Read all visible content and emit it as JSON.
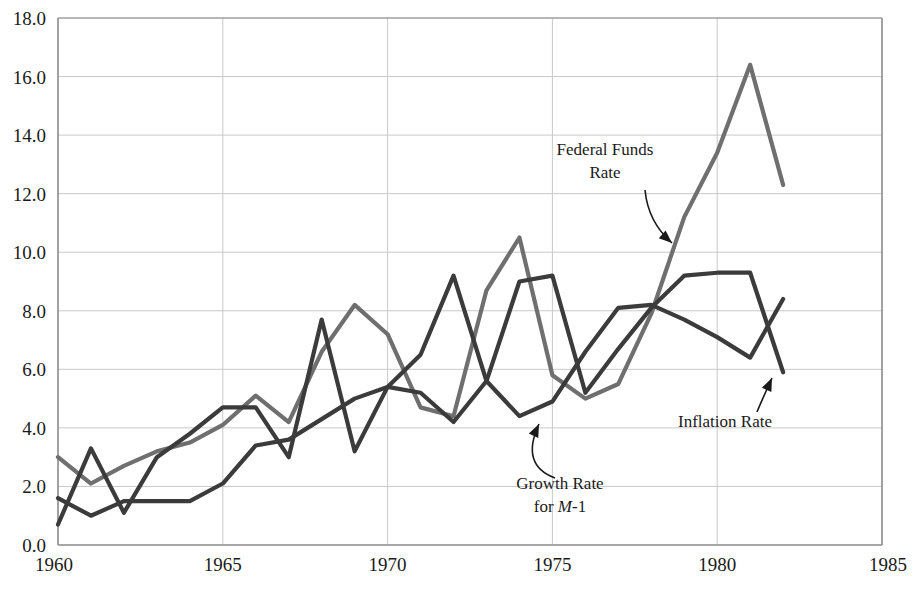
{
  "chart_data": {
    "type": "line",
    "title": "",
    "xlabel": "",
    "ylabel": "",
    "xlim": [
      1960,
      1985
    ],
    "ylim": [
      0.0,
      18.0
    ],
    "grid": true,
    "legend_position": "inline-annotations",
    "x_ticks": [
      "1960",
      "1965",
      "1970",
      "1975",
      "1980",
      "1985"
    ],
    "x_tick_values": [
      1960,
      1965,
      1970,
      1975,
      1980,
      1985
    ],
    "y_ticks": [
      "0.0",
      "2.0",
      "4.0",
      "6.0",
      "8.0",
      "10.0",
      "12.0",
      "14.0",
      "16.0",
      "18.0"
    ],
    "y_tick_values": [
      0.0,
      2.0,
      4.0,
      6.0,
      8.0,
      10.0,
      12.0,
      14.0,
      16.0,
      18.0
    ],
    "x": [
      1960,
      1961,
      1962,
      1963,
      1964,
      1965,
      1966,
      1967,
      1968,
      1969,
      1970,
      1971,
      1972,
      1973,
      1974,
      1975,
      1976,
      1977,
      1978,
      1979,
      1980,
      1981,
      1982
    ],
    "series": [
      {
        "name": "Federal Funds Rate",
        "color": "#6f6f6f",
        "values": [
          3.0,
          2.1,
          2.7,
          3.2,
          3.5,
          4.1,
          5.1,
          4.2,
          6.6,
          8.2,
          7.2,
          4.7,
          4.4,
          8.7,
          10.5,
          5.8,
          5.0,
          5.5,
          7.9,
          11.2,
          13.4,
          16.4,
          12.3
        ]
      },
      {
        "name": "Growth Rate for M-1",
        "color": "#3b3b3b",
        "values": [
          0.7,
          3.3,
          1.1,
          3.0,
          3.8,
          4.7,
          4.7,
          3.0,
          7.7,
          3.2,
          5.4,
          6.5,
          9.2,
          5.6,
          4.4,
          4.9,
          6.6,
          8.1,
          8.2,
          7.7,
          7.1,
          6.4,
          8.4
        ]
      },
      {
        "name": "Inflation Rate",
        "color": "#3b3b3b",
        "values": [
          1.6,
          1.0,
          1.5,
          1.5,
          1.5,
          2.1,
          3.4,
          3.6,
          4.3,
          5.0,
          5.4,
          5.2,
          4.2,
          5.6,
          9.0,
          9.2,
          5.2,
          6.7,
          8.1,
          9.2,
          9.3,
          9.3,
          5.9
        ]
      }
    ],
    "annotations": [
      {
        "id": "federal-funds-rate",
        "line1": "Federal Funds",
        "line2": "Rate",
        "text_x": 605,
        "text_y": 155,
        "arrow_from": [
          645,
          190
        ],
        "arrow_ctrl": [
          648,
          222
        ],
        "arrow_to": [
          672,
          243
        ]
      },
      {
        "id": "growth-rate-m1",
        "line1": "Growth Rate",
        "line2": "for ",
        "line2_italic": "M",
        "line2_tail": "-1",
        "text_x": 560,
        "text_y": 489,
        "arrow_from": [
          555,
          478
        ],
        "arrow_ctrl": [
          520,
          465
        ],
        "arrow_to": [
          539,
          424
        ]
      },
      {
        "id": "inflation-rate",
        "line1": "Inflation Rate",
        "text_x": 725,
        "text_y": 427,
        "arrow_from": [
          757,
          412
        ],
        "arrow_ctrl": [
          762,
          400
        ],
        "arrow_to": [
          772,
          378
        ]
      }
    ]
  },
  "axes": {
    "plot_left": 58,
    "plot_right": 882,
    "plot_top": 18,
    "plot_bottom": 545,
    "axis_color": "#8a8a8a",
    "grid_color": "#c9c9c9"
  }
}
